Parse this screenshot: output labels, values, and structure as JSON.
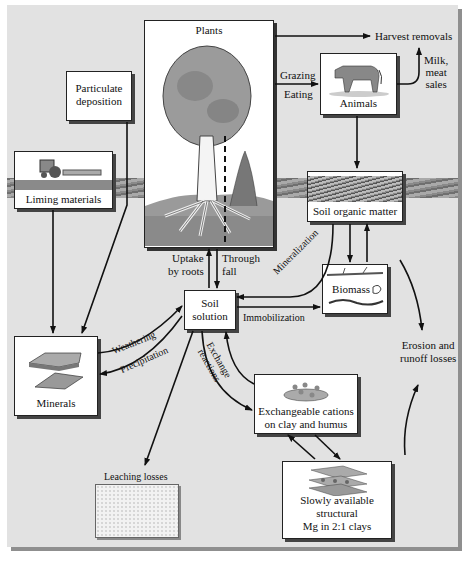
{
  "diagram": {
    "nodes": {
      "plants": "Plants",
      "harvest": "Harvest removals",
      "animals": "Animals",
      "milk": [
        "Milk,",
        "meat",
        "sales"
      ],
      "particulate": [
        "Particulate",
        "deposition"
      ],
      "liming": "Liming materials",
      "som": "Soil organic matter",
      "biomass": "Biomass",
      "soil_solution": [
        "Soil",
        "solution"
      ],
      "minerals": "Minerals",
      "exchangeable": [
        "Exchangeable cations",
        "on clay and humus"
      ],
      "leaching": "Leaching losses",
      "slowly": [
        "Slowly available",
        "structural",
        "Mg in 2:1 clays"
      ],
      "erosion": [
        "Erosion and",
        "runoff losses"
      ]
    },
    "edge_labels": {
      "grazing": "Grazing",
      "eating": "Eating",
      "uptake": [
        "Uptake",
        "by roots"
      ],
      "throughfall": [
        "Through",
        "fall"
      ],
      "mineralization": "Mineralization",
      "immobilization": "Immobilization",
      "weathering": "Weathering",
      "precipitation": "Precipitation",
      "exchange": [
        "Exchange",
        "reactions"
      ]
    },
    "colors": {
      "background": "#e2e2e2",
      "box": "#ffffff",
      "soil": "#8a8a8a",
      "lines": "#111111"
    }
  }
}
